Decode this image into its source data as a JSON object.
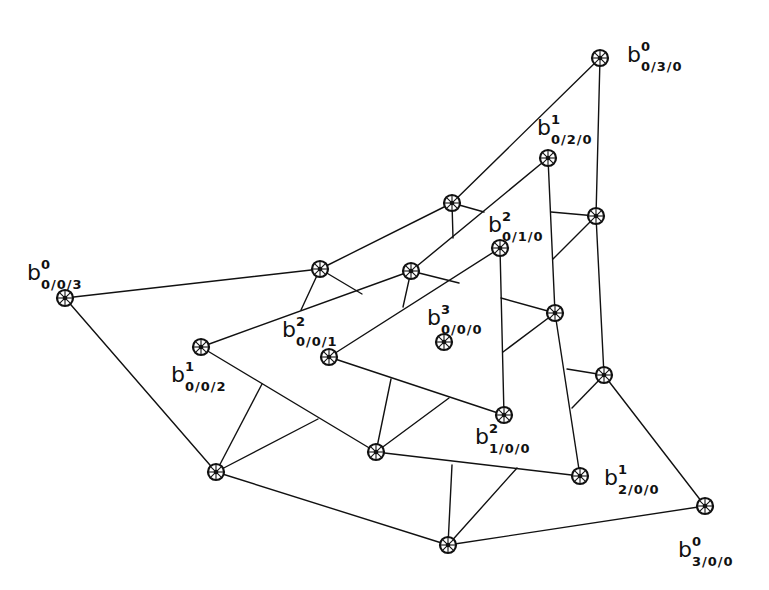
{
  "diagram": {
    "type": "control-net",
    "colors": {
      "stroke": "#111111",
      "background": "#ffffff"
    },
    "nodes": [
      {
        "id": "b0_003",
        "x": 65,
        "y": 298
      },
      {
        "id": "b0_030",
        "x": 600,
        "y": 58
      },
      {
        "id": "b0_300",
        "x": 705,
        "y": 506
      },
      {
        "id": "o_ab1",
        "x": 320,
        "y": 269
      },
      {
        "id": "o_ab2",
        "x": 452,
        "y": 203
      },
      {
        "id": "o_bc1",
        "x": 596,
        "y": 216
      },
      {
        "id": "o_bc2",
        "x": 604,
        "y": 375
      },
      {
        "id": "o_ca1",
        "x": 448,
        "y": 545
      },
      {
        "id": "o_ca2",
        "x": 216,
        "y": 472
      },
      {
        "id": "b1_002",
        "x": 201,
        "y": 347
      },
      {
        "id": "b1_020",
        "x": 548,
        "y": 158
      },
      {
        "id": "b1_200",
        "x": 580,
        "y": 476
      },
      {
        "id": "m_1",
        "x": 411,
        "y": 271
      },
      {
        "id": "m_2",
        "x": 555,
        "y": 313
      },
      {
        "id": "m_3",
        "x": 376,
        "y": 452
      },
      {
        "id": "b2_001",
        "x": 329,
        "y": 357
      },
      {
        "id": "b2_010",
        "x": 500,
        "y": 248
      },
      {
        "id": "b2_100",
        "x": 504,
        "y": 415
      },
      {
        "id": "b3_000",
        "x": 444,
        "y": 342
      }
    ],
    "edges": [
      [
        65,
        298,
        320,
        269
      ],
      [
        320,
        269,
        452,
        203
      ],
      [
        452,
        203,
        600,
        58
      ],
      [
        600,
        58,
        596,
        216
      ],
      [
        596,
        216,
        604,
        375
      ],
      [
        604,
        375,
        705,
        506
      ],
      [
        705,
        506,
        448,
        545
      ],
      [
        448,
        545,
        216,
        472
      ],
      [
        216,
        472,
        65,
        298
      ],
      [
        201,
        347,
        411,
        271
      ],
      [
        411,
        271,
        548,
        158
      ],
      [
        548,
        158,
        555,
        313
      ],
      [
        555,
        313,
        580,
        476
      ],
      [
        580,
        476,
        376,
        452
      ],
      [
        376,
        452,
        201,
        347
      ],
      [
        329,
        357,
        500,
        248
      ],
      [
        500,
        248,
        504,
        415
      ],
      [
        504,
        415,
        329,
        357
      ],
      [
        320,
        269,
        301,
        310
      ],
      [
        320,
        269,
        362,
        294
      ],
      [
        452,
        203,
        453,
        238
      ],
      [
        452,
        203,
        484,
        212
      ],
      [
        596,
        216,
        551,
        212
      ],
      [
        596,
        216,
        553,
        259
      ],
      [
        604,
        375,
        567,
        369
      ],
      [
        604,
        375,
        572,
        408
      ],
      [
        448,
        545,
        452,
        465
      ],
      [
        448,
        545,
        517,
        468
      ],
      [
        216,
        472,
        262,
        384
      ],
      [
        216,
        472,
        318,
        419
      ],
      [
        411,
        271,
        403,
        307
      ],
      [
        411,
        271,
        459,
        283
      ],
      [
        555,
        313,
        501,
        298
      ],
      [
        555,
        313,
        503,
        352
      ],
      [
        376,
        452,
        391,
        379
      ],
      [
        376,
        452,
        449,
        398
      ]
    ],
    "labels": [
      {
        "node": "b0_030",
        "base": "b",
        "sup": "0",
        "sub": "0/3/0",
        "x": 627,
        "y": 62
      },
      {
        "node": "b1_020",
        "base": "b",
        "sup": "1",
        "sub": "0/2/0",
        "x": 537,
        "y": 135
      },
      {
        "node": "b2_010",
        "base": "b",
        "sup": "2",
        "sub": "0/1/0",
        "x": 488,
        "y": 232
      },
      {
        "node": "b0_003",
        "base": "b",
        "sup": "0",
        "sub": "0/0/3",
        "x": 27,
        "y": 280
      },
      {
        "node": "b2_001",
        "base": "b",
        "sup": "2",
        "sub": "0/0/1",
        "x": 282,
        "y": 337
      },
      {
        "node": "b3_000",
        "base": "b",
        "sup": "3",
        "sub": "0/0/0",
        "x": 427,
        "y": 325
      },
      {
        "node": "b1_002",
        "base": "b",
        "sup": "1",
        "sub": "0/0/2",
        "x": 171,
        "y": 382
      },
      {
        "node": "b2_100",
        "base": "b",
        "sup": "2",
        "sub": "1/0/0",
        "x": 475,
        "y": 444
      },
      {
        "node": "b1_200",
        "base": "b",
        "sup": "1",
        "sub": "2/0/0",
        "x": 604,
        "y": 485
      },
      {
        "node": "b0_300",
        "base": "b",
        "sup": "0",
        "sub": "3/0/0",
        "x": 678,
        "y": 557
      }
    ]
  }
}
